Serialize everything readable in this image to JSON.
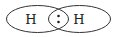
{
  "diagram": {
    "atoms": [
      {
        "symbol": "H",
        "x": 31,
        "y": 23
      },
      {
        "symbol": "H",
        "x": 80,
        "y": 23
      }
    ],
    "shared_pair": ":",
    "colors": {
      "stroke": "#333333",
      "text": "#222222",
      "background": "#ffffff"
    }
  }
}
